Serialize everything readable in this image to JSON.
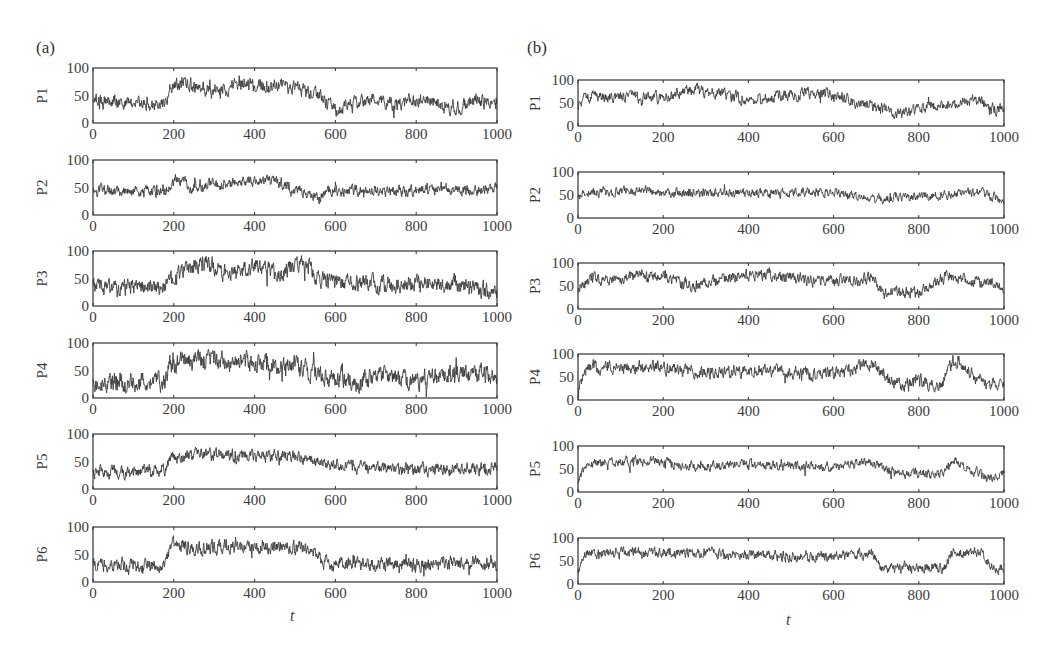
{
  "figure": {
    "panels": [
      {
        "id": "a",
        "label": "(a)",
        "xlabel": "t"
      },
      {
        "id": "b",
        "label": "(b)",
        "xlabel": "t"
      }
    ]
  },
  "chart_data": [
    {
      "type": "line",
      "panel": "(a)",
      "title": "",
      "xlabel": "t",
      "xlim": [
        0,
        1000
      ],
      "ylim": [
        0,
        100
      ],
      "xticks": [
        0,
        200,
        400,
        600,
        800,
        1000
      ],
      "yticks": [
        0,
        50,
        100
      ],
      "grid": false,
      "legend": "none",
      "series": [
        {
          "name": "P1",
          "ylabel": "P1",
          "profile_t": [
            0,
            180,
            190,
            220,
            300,
            350,
            420,
            500,
            560,
            600,
            640,
            700,
            760,
            800,
            900,
            930,
            1000
          ],
          "profile_v": [
            40,
            35,
            60,
            75,
            55,
            70,
            68,
            65,
            50,
            25,
            30,
            45,
            30,
            45,
            25,
            40,
            38
          ],
          "noise": 10
        },
        {
          "name": "P2",
          "ylabel": "P2",
          "profile_t": [
            0,
            180,
            200,
            250,
            350,
            450,
            560,
            600,
            1000
          ],
          "profile_v": [
            45,
            42,
            65,
            50,
            60,
            62,
            30,
            45,
            45
          ],
          "noise": 8
        },
        {
          "name": "P3",
          "ylabel": "P3",
          "profile_t": [
            0,
            50,
            180,
            200,
            280,
            320,
            430,
            460,
            520,
            560,
            700,
            900,
            1000
          ],
          "profile_v": [
            35,
            30,
            35,
            55,
            80,
            60,
            70,
            55,
            85,
            45,
            40,
            38,
            25
          ],
          "noise": 12
        },
        {
          "name": "P4",
          "ylabel": "P4",
          "profile_t": [
            0,
            180,
            190,
            260,
            340,
            500,
            560,
            650,
            700,
            800,
            900,
            1000
          ],
          "profile_v": [
            30,
            28,
            60,
            72,
            65,
            60,
            45,
            30,
            40,
            30,
            45,
            45
          ],
          "noise": 14
        },
        {
          "name": "P5",
          "ylabel": "P5",
          "profile_t": [
            0,
            180,
            190,
            260,
            340,
            500,
            560,
            650,
            800,
            1000
          ],
          "profile_v": [
            30,
            32,
            55,
            62,
            60,
            58,
            48,
            40,
            35,
            40
          ],
          "noise": 9
        },
        {
          "name": "P6",
          "ylabel": "P6",
          "profile_t": [
            0,
            180,
            190,
            290,
            300,
            500,
            560,
            570,
            1000
          ],
          "profile_v": [
            30,
            30,
            68,
            58,
            65,
            62,
            55,
            32,
            35
          ],
          "noise": 10
        }
      ]
    },
    {
      "type": "line",
      "panel": "(b)",
      "title": "",
      "xlabel": "t",
      "xlim": [
        0,
        1000
      ],
      "ylim": [
        0,
        100
      ],
      "xticks": [
        0,
        200,
        400,
        600,
        800,
        1000
      ],
      "yticks": [
        0,
        50,
        100
      ],
      "grid": false,
      "legend": "none",
      "series": [
        {
          "name": "P1",
          "ylabel": "P1",
          "profile_t": [
            0,
            20,
            200,
            280,
            380,
            450,
            560,
            620,
            700,
            750,
            800,
            940,
            970,
            1000
          ],
          "profile_v": [
            50,
            65,
            62,
            80,
            62,
            60,
            75,
            62,
            40,
            25,
            40,
            60,
            40,
            35
          ],
          "noise": 10
        },
        {
          "name": "P2",
          "ylabel": "P2",
          "profile_t": [
            0,
            120,
            200,
            500,
            600,
            700,
            800,
            950,
            1000
          ],
          "profile_v": [
            52,
            62,
            55,
            55,
            58,
            40,
            45,
            58,
            35
          ],
          "noise": 8
        },
        {
          "name": "P3",
          "ylabel": "P3",
          "profile_t": [
            0,
            20,
            200,
            260,
            360,
            420,
            540,
            560,
            700,
            710,
            800,
            860,
            1000
          ],
          "profile_v": [
            45,
            62,
            72,
            50,
            70,
            75,
            62,
            60,
            65,
            38,
            35,
            70,
            50
          ],
          "noise": 10
        },
        {
          "name": "P4",
          "ylabel": "P4",
          "profile_t": [
            0,
            20,
            180,
            250,
            400,
            600,
            690,
            750,
            800,
            850,
            880,
            960,
            1000
          ],
          "profile_v": [
            20,
            70,
            75,
            60,
            62,
            58,
            75,
            30,
            45,
            25,
            85,
            30,
            35
          ],
          "noise": 11
        },
        {
          "name": "P5",
          "ylabel": "P5",
          "profile_t": [
            0,
            20,
            180,
            250,
            400,
            600,
            680,
            750,
            800,
            860,
            880,
            960,
            1000
          ],
          "profile_v": [
            25,
            60,
            70,
            55,
            60,
            55,
            65,
            40,
            40,
            40,
            70,
            30,
            40
          ],
          "noise": 8
        },
        {
          "name": "P6",
          "ylabel": "P6",
          "profile_t": [
            0,
            20,
            200,
            400,
            500,
            690,
            710,
            860,
            880,
            950,
            970,
            1000
          ],
          "profile_v": [
            30,
            68,
            68,
            65,
            58,
            65,
            35,
            35,
            68,
            68,
            35,
            35
          ],
          "noise": 9
        }
      ]
    }
  ]
}
